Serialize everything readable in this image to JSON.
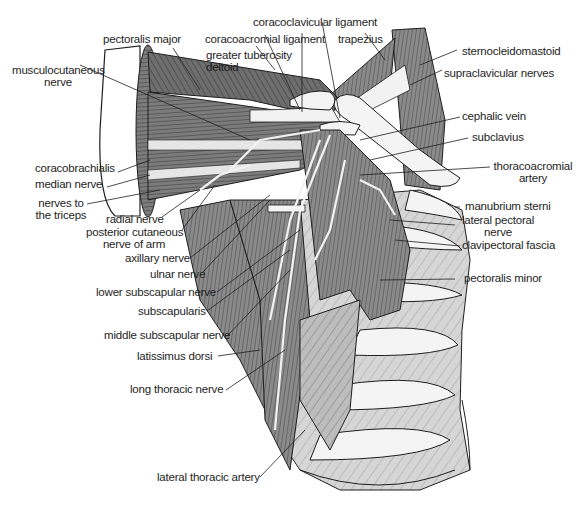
{
  "figure": {
    "colors": {
      "muscle_dark": "#7a7a7a",
      "muscle_mid": "#9a9a9a",
      "muscle_light": "#c4c4c4",
      "bone": "#f4f4f4",
      "line": "#1e1e1e",
      "background": "#ffffff"
    }
  },
  "labels": {
    "coracoclavicular_ligament": "coracoclavicular ligament",
    "coracoacromial_ligament": "coracoacromial ligament",
    "trapezius": "trapezius",
    "pectoralis_major": "pectoralis major",
    "greater_tuberosity": "greater tuberosity",
    "deltoid": "deltoid",
    "sternocleidomastoid": "sternocleidomastoid",
    "musculocutaneous_nerve_1": "musculocutaneous",
    "musculocutaneous_nerve_2": "nerve",
    "supraclavicular_nerves": "supraclavicular nerves",
    "cephalic_vein": "cephalic vein",
    "subclavius": "subclavius",
    "coracobrachialis": "coracobrachialis",
    "median_nerve": "median nerve",
    "thoracoacromial_artery_1": "thoracoacromial",
    "thoracoacromial_artery_2": "artery",
    "nerves_to_triceps_1": "nerves to",
    "nerves_to_triceps_2": "the triceps",
    "radial_nerve": "radial nerve",
    "manubrium_sterni": "manubrium sterni",
    "posterior_cutaneous_1": "posterior cutaneous",
    "posterior_cutaneous_2": "nerve of arm",
    "lateral_pectoral_nerve_1": "lateral pectoral",
    "lateral_pectoral_nerve_2": "nerve",
    "clavipectoral_fascia": "clavipectoral fascia",
    "axillary_nerve": "axillary nerve",
    "ulnar_nerve": "ulnar nerve",
    "pectoralis_minor": "pectoralis minor",
    "lower_subscapular_nerve": "lower subscapular nerve",
    "subscapularis": "subscapularis",
    "middle_subscapular_nerve": "middle subscapular nerve",
    "latissimus_dorsi": "latissimus dorsi",
    "long_thoracic_nerve": "long thoracic nerve",
    "lateral_thoracic_artery": "lateral thoracic artery"
  }
}
